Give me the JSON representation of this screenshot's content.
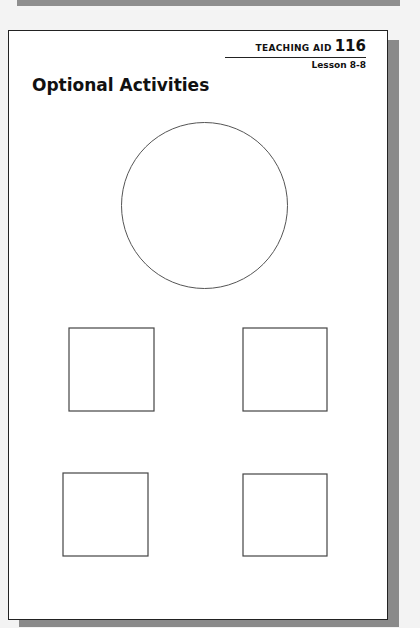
{
  "header": {
    "aid_label": "TEACHING AID",
    "aid_number": "116",
    "lesson": "Lesson 8-8"
  },
  "title": "Optional Activities",
  "shapes": {
    "circle": {
      "cx": 203.5,
      "cy": 204.5,
      "r": 83,
      "stroke": "#555555"
    },
    "squares": [
      {
        "x": 68,
        "y": 327,
        "w": 85,
        "h": 83
      },
      {
        "x": 242,
        "y": 327,
        "w": 84,
        "h": 83
      },
      {
        "x": 62,
        "y": 472,
        "w": 85,
        "h": 83
      },
      {
        "x": 242,
        "y": 473,
        "w": 84,
        "h": 82
      }
    ],
    "square_stroke": "#444444"
  },
  "colors": {
    "background": "#f3f3f3",
    "shadow": "#8a8a8a",
    "page": "#ffffff",
    "border": "#222222"
  }
}
